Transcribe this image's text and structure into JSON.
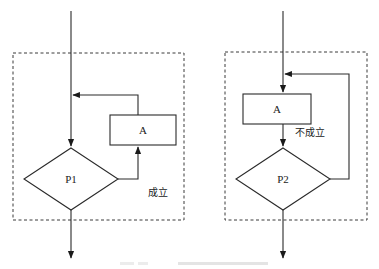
{
  "diagram": {
    "type": "flowchart",
    "title": "",
    "left": {
      "name": "while-loop structure",
      "process_label": "A",
      "condition_label": "P1",
      "branch_label": "成立"
    },
    "right": {
      "name": "do-until loop structure",
      "process_label": "A",
      "condition_label": "P2",
      "branch_label": "不成立"
    },
    "caption": ""
  }
}
